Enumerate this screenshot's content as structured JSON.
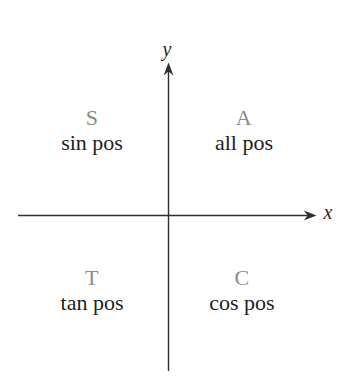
{
  "diagram": {
    "title_semantic": "ASTC trig quadrant mnemonic diagram",
    "background_color": "#ffffff",
    "axes": {
      "x_label": "x",
      "y_label": "y",
      "line_color": "#2f2f2f",
      "label_color": "#2a2a2a"
    },
    "quadrants": [
      {
        "id": "II",
        "letter": "S",
        "caption": "sin pos"
      },
      {
        "id": "I",
        "letter": "A",
        "caption": "all pos"
      },
      {
        "id": "III",
        "letter": "T",
        "caption": "tan pos"
      },
      {
        "id": "IV",
        "letter": "C",
        "caption": "cos pos"
      }
    ],
    "letter_color": "#8c8c8c",
    "caption_color": "#1e1e1e"
  }
}
